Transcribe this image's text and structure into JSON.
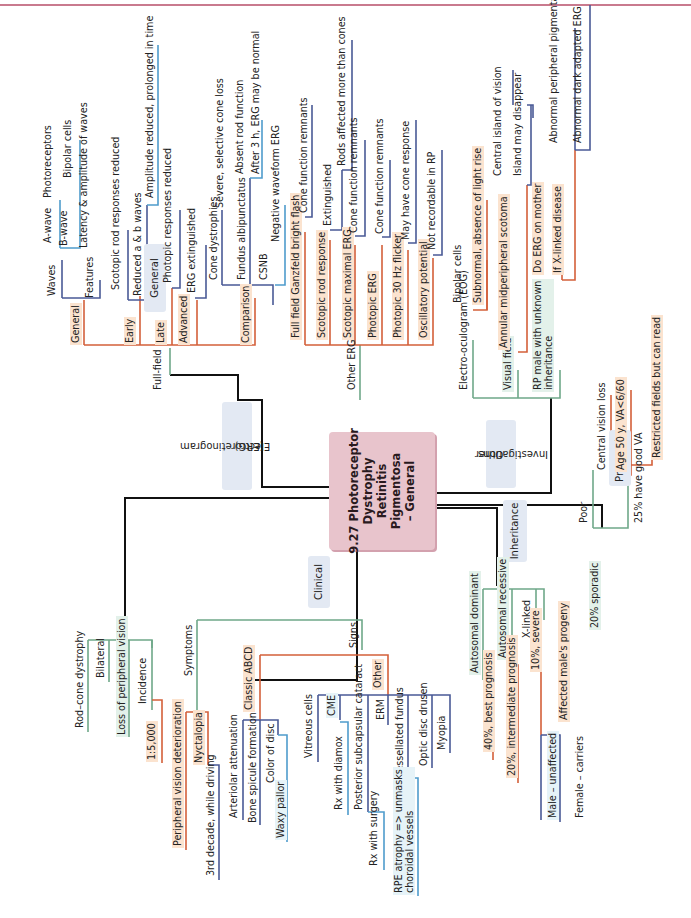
{
  "center": {
    "line1": "9.27 Photoreceptor",
    "line2": "Dystrophy",
    "line3": "Retinitis",
    "line4": "Pigmentosa",
    "line5": "– General"
  },
  "categories": {
    "general": "General",
    "erg_l1": "Electroretinogram",
    "erg_l2": "(ERG)",
    "clinical": "Clinical",
    "inheritance": "Inheritance",
    "other_l1": "Other",
    "other_l2": "Investigations",
    "prognosis": "Prognosis"
  },
  "general": {
    "items": [
      "Rod–cone dystrophy",
      "Bilateral",
      "Loss of peripheral vision",
      "Incidence"
    ],
    "incidence_value": "1:5,000"
  },
  "erg": {
    "full_field": "Full-field",
    "general": "General",
    "waves": "Waves",
    "a_wave": "A-wave",
    "a_wave_detail": "Photoreceptors",
    "b_wave": "B-wave",
    "b_wave_detail": "Bipolar cells",
    "features": "Features",
    "features_detail": "Latency & amplitude of waves",
    "early": "Early",
    "early_1": "Scotopic rod responses reduced",
    "early_2": "Reduced a & b waves",
    "early_2_detail": "Amplitude reduced, prolonged in time",
    "late": "Late",
    "late_1": "Photopic responses reduced",
    "advanced": "Advanced",
    "advanced_1": "ERG extinguished",
    "comparison": "Comparison",
    "cone_dystrophies": "Cone dystrophies",
    "cone_dystrophies_detail": "Severe, selective cone loss",
    "fundus_albi": "Fundus albipunctatus",
    "fundus_albi_1": "Absent rod function",
    "fundus_albi_2": "After 3 h, ERG may be normal",
    "csnb": "CSNB",
    "csnb_detail": "Negative waveform ERG",
    "other_erg": "Other ERG",
    "ganzfeld": "Full field Ganzfeld bright flash",
    "ganzfeld_detail": "Cone function remnants",
    "scotopic_rod": "Scotopic rod response",
    "scotopic_rod_detail": "Extinguished",
    "scotopic_rod_detail2": "Rods affected more than cones",
    "scotopic_max": "Scotopic maximal ERG",
    "scotopic_max_detail": "Cone function remnants",
    "photopic": "Photopic ERG",
    "photopic_detail": "Cone function remnants",
    "flicker": "Photopic 30 Hz flicker",
    "flicker_detail": "May have cone response",
    "oscillatory": "Oscillatory potential",
    "oscillatory_detail": "Not recordable in RP"
  },
  "other": {
    "eog": "Electro-oculogram (EOG)",
    "eog_1": "Bipolar cells",
    "eog_2": "Subnormal, absence of light rise",
    "visual_field": "Visual field",
    "vf_1": "Annular midperipheral scotoma",
    "vf_1a": "Central island of vision",
    "vf_1b": "Island may disappear",
    "rp_male_l1": "RP male with unknown",
    "rp_male_l2": "inheritance",
    "rp_1": "Do ERG on mother",
    "rp_2": "If X-linked disease",
    "rp_2a": "Abnormal peripheral pigmentation",
    "rp_2b": "Abnormal dark adapted ERG"
  },
  "prognosis": {
    "poor": "Poor",
    "poor_1": "Central vision loss",
    "poor_2": "Age 50 y, VA<6/60",
    "good": "25% have good VA",
    "good_1": "Restricted fields but can read"
  },
  "clinical": {
    "symptoms": "Symptoms",
    "nyctalopia": "Nyctalopia",
    "nyctalopia_detail": "3rd decade, while driving",
    "peripheral": "Peripheral vision deterioration",
    "signs": "Signs",
    "classic": "Classic ABCD",
    "arteriolar": "Arteriolar attenuation",
    "bone": "Bone spicule formation",
    "disc": "Color of disc",
    "disc_detail": "Waxy pallor",
    "other": "Other",
    "vitreous": "Vitreous cells",
    "cme": "CME",
    "cme_detail": "Rx with diamox",
    "psc": "Posterior subcapsular cataract",
    "psc_detail": "Rx with surgery",
    "erm": "ERM",
    "tessellated": "Tessellated fundus",
    "tessellated_l1": "RPE atrophy => unmasks",
    "tessellated_l2": "choroidal vessels",
    "drusen": "Optic disc drusen",
    "myopia": "Myopia"
  },
  "inheritance": {
    "ad": "Autosomal dominant",
    "ad_detail": "40%, best prognosis",
    "ar": "Autosomal recessive",
    "ar_detail": "20%, intermediate prognosis",
    "xl": "X-linked",
    "xl_1": "10%, severe",
    "xl_2": "Affected male's progeny",
    "xl_2a": "Male – unaffected",
    "xl_2b": "Female – carriers",
    "sporadic": "20% sporadic"
  },
  "colors": {
    "center": "#e8c4cc",
    "trunk": "#111111",
    "green": "#6fa889",
    "orange": "#d4603a",
    "navy": "#4a5a96",
    "blue": "#4f9ccc",
    "topline": "#c97a8e"
  }
}
